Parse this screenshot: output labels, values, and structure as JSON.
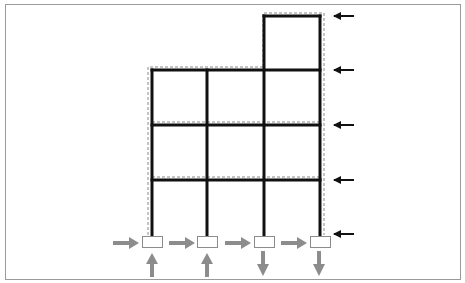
{
  "figure": {
    "colors": {
      "frame": "#111111",
      "dashed_outline": "#8a8a8a",
      "load_arrows": "#111111",
      "reaction_arrows": "#8c8c8c",
      "support_box": "#8c8c8c",
      "border": "#9a9a9a",
      "background": "#ffffff"
    },
    "frame": {
      "bays": 3,
      "storeys_main": 3,
      "rooftop_storeys": 1,
      "column_x": [
        152,
        207,
        264,
        320
      ],
      "main_beam_y": [
        70,
        125,
        180
      ],
      "base_y": 235,
      "rooftop_top_y": 16
    },
    "lateral_loads": {
      "direction": "leftward",
      "count": 5,
      "y": [
        16,
        70,
        125,
        180,
        234
      ]
    },
    "supports": {
      "count": 4,
      "horizontal_reactions": {
        "direction": "rightward",
        "count": 4
      },
      "vertical_reactions": [
        "up",
        "up",
        "down",
        "down"
      ]
    }
  }
}
